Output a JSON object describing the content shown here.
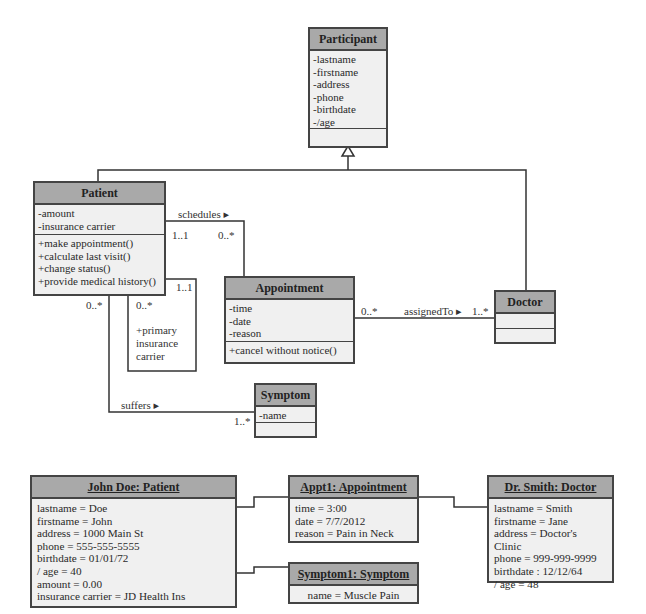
{
  "class_diagram": {
    "classes": {
      "participant": {
        "name": "Participant",
        "attributes": [
          "-lastname",
          "-firstname",
          "-address",
          "-phone",
          "-birthdate",
          "-/age"
        ],
        "operations": []
      },
      "patient": {
        "name": "Patient",
        "attributes": [
          "-amount",
          "-insurance carrier"
        ],
        "operations": [
          "+make appointment()",
          "+calculate last visit()",
          "+change status()",
          "+provide medical history()"
        ]
      },
      "appointment": {
        "name": "Appointment",
        "attributes": [
          "-time",
          "-date",
          "-reason"
        ],
        "operations": [
          "+cancel without notice()"
        ]
      },
      "doctor": {
        "name": "Doctor",
        "attributes": [],
        "operations": []
      },
      "symptom": {
        "name": "Symptom",
        "attributes": [
          "-name"
        ],
        "operations": []
      }
    },
    "associations": {
      "schedules": {
        "label": "schedules ▸",
        "source_mult": "1..1",
        "target_mult": "0..*"
      },
      "assigned_to": {
        "label": "assignedTo ▸",
        "source_mult": "0..*",
        "target_mult": "1..*"
      },
      "suffers": {
        "label": "suffers ▸",
        "source_mult": "0..*",
        "target_mult": "1..*"
      },
      "insurance": {
        "role": [
          "+primary",
          "insurance",
          "carrier"
        ],
        "source_mult": "1..1",
        "target_mult": "0..*"
      }
    },
    "generalization": {
      "parent": "Participant",
      "children": [
        "Patient",
        "Doctor"
      ]
    }
  },
  "object_diagram": {
    "john_doe": {
      "title": "John Doe: Patient",
      "values": [
        "lastname = Doe",
        "firstname = John",
        "address = 1000 Main St",
        "phone = 555-555-5555",
        "birthdate = 01/01/72",
        "/ age = 40",
        "amount = 0.00",
        "insurance carrier = JD Health Ins"
      ]
    },
    "appt1": {
      "title": "Appt1: Appointment",
      "values": [
        "time = 3:00",
        "date = 7/7/2012",
        "reason = Pain in Neck"
      ]
    },
    "symptom1": {
      "title": "Symptom1: Symptom",
      "values": [
        "name = Muscle Pain"
      ]
    },
    "dr_smith": {
      "title": "Dr. Smith: Doctor",
      "values": [
        "lastname = Smith",
        "firstname = Jane",
        "address = Doctor's Clinic",
        "phone = 999-999-9999",
        "birthdate : 12/12/64",
        "/ age = 48"
      ]
    }
  },
  "colors": {
    "header": "#a9a9a9",
    "body": "#f0f0f0",
    "border": "#444444"
  }
}
